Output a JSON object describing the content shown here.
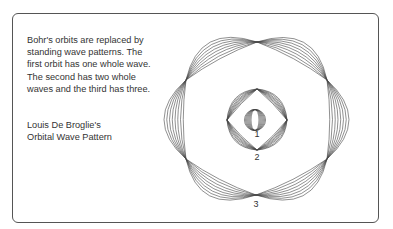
{
  "caption": "Bohr's orbits are replaced by standing wave patterns. The first orbit has one whole wave. The second has two whole waves and the third has three.",
  "title_line1": "Louis De Broglie's",
  "title_line2": "Orbital Wave Pattern",
  "orbit_labels": [
    "1",
    "2",
    "3"
  ],
  "colors": {
    "stroke": "#444444",
    "frame": "#555555",
    "text": "#333333"
  }
}
